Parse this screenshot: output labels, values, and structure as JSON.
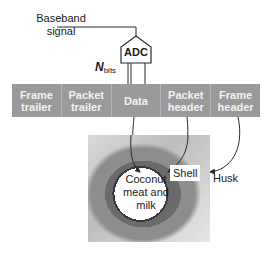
{
  "diagram": {
    "input_label": "Baseband signal",
    "input_label_lines": [
      "Baseband",
      "signal"
    ],
    "adc": {
      "label": "ADC"
    },
    "nbits": {
      "symbol": "N",
      "subscript": "bits"
    },
    "frame_segments": [
      {
        "line1": "Frame",
        "line2": "trailer"
      },
      {
        "line1": "Packet",
        "line2": "trailer"
      },
      {
        "line1": "Data",
        "line2": ""
      },
      {
        "line1": "Packet",
        "line2": "header"
      },
      {
        "line1": "Frame",
        "line2": "header"
      }
    ],
    "coconut_labels": {
      "meat": "Coconut meat and milk",
      "meat_lines": [
        "Coconut",
        "meat and milk"
      ],
      "shell": "Shell",
      "husk": "Husk"
    },
    "mappings": [
      {
        "from": "Data",
        "to": "Coconut meat and milk"
      },
      {
        "from": "Packet header",
        "to": "Shell"
      },
      {
        "from": "Frame header",
        "to": "Husk"
      }
    ],
    "colors": {
      "bar_fill": "#9a9a9a",
      "bar_text": "#f2f2f2",
      "line": "#2a2a2a"
    }
  }
}
